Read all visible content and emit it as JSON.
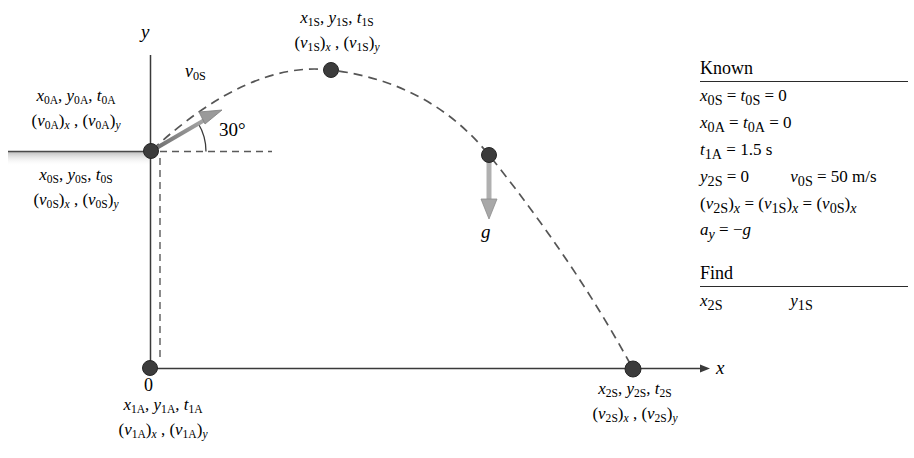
{
  "figure": {
    "type": "projectile-motion-free-body-diagram",
    "axes": {
      "x_label": "x",
      "y_label": "y",
      "origin_label": "0"
    },
    "angle": {
      "value": "30°"
    },
    "gravity": {
      "label": "g"
    },
    "velocity_vector": {
      "label_base": "v",
      "label_sub": "0S"
    }
  },
  "labels": {
    "launch_above": {
      "line1": [
        {
          "base": "x",
          "sub": "0A"
        },
        {
          "base": "y",
          "sub": "0A"
        },
        {
          "base": "t",
          "sub": "0A"
        }
      ],
      "line2": [
        {
          "paren": "v",
          "sub": "0A",
          "comp": "x"
        },
        {
          "paren": "v",
          "sub": "0A",
          "comp": "y"
        }
      ]
    },
    "launch_below": {
      "line1": [
        {
          "base": "x",
          "sub": "0S"
        },
        {
          "base": "y",
          "sub": "0S"
        },
        {
          "base": "t",
          "sub": "0S"
        }
      ],
      "line2": [
        {
          "paren": "v",
          "sub": "0S",
          "comp": "x"
        },
        {
          "paren": "v",
          "sub": "0S",
          "comp": "y"
        }
      ]
    },
    "apex": {
      "line1": [
        {
          "base": "x",
          "sub": "1S"
        },
        {
          "base": "y",
          "sub": "1S"
        },
        {
          "base": "t",
          "sub": "1S"
        }
      ],
      "line2": [
        {
          "paren": "v",
          "sub": "1S",
          "comp": "x"
        },
        {
          "paren": "v",
          "sub": "1S",
          "comp": "y"
        }
      ]
    },
    "origin_below": {
      "line1": [
        {
          "base": "x",
          "sub": "1A"
        },
        {
          "base": "y",
          "sub": "1A"
        },
        {
          "base": "t",
          "sub": "1A"
        }
      ],
      "line2": [
        {
          "paren": "v",
          "sub": "1A",
          "comp": "x"
        },
        {
          "paren": "v",
          "sub": "1A",
          "comp": "y"
        }
      ]
    },
    "landing": {
      "line1": [
        {
          "base": "x",
          "sub": "2S"
        },
        {
          "base": "y",
          "sub": "2S"
        },
        {
          "base": "t",
          "sub": "2S"
        }
      ],
      "line2": [
        {
          "paren": "v",
          "sub": "2S",
          "comp": "x"
        },
        {
          "paren": "v",
          "sub": "2S",
          "comp": "y"
        }
      ]
    }
  },
  "known_panel": {
    "heading": "Known",
    "lines": [
      "x<sub>0S</sub> = t<sub>0S</sub> = 0",
      "x<sub>0A</sub> = t<sub>0A</sub> = 0",
      "t<sub>1A</sub> = 1.5 s",
      "y<sub>2S</sub> = 0",
      "v<sub>0S</sub> = 50 m/s",
      "(v<sub>2S</sub>)<sub>x</sub> = (v<sub>1S</sub>)<sub>x</sub> = (v<sub>0S</sub>)<sub>x</sub>",
      "a<sub>y</sub> = −g"
    ],
    "plain": {
      "l1": "x0S = t0S = 0",
      "l2": "x0A = t0A = 0",
      "l3": "t1A = 1.5 s",
      "l4a": "y2S = 0",
      "l4b": "v0S = 50 m/s",
      "l5": "(v2S)x = (v1S)x = (v0S)x",
      "l6": "ay = −g"
    },
    "values": {
      "t1A": "1.5 s",
      "v0S": "50 m/s",
      "y2S": "0",
      "angle": "30°"
    }
  },
  "find_panel": {
    "heading": "Find",
    "items": [
      {
        "base": "x",
        "sub": "2S"
      },
      {
        "base": "y",
        "sub": "1S"
      }
    ]
  },
  "colors": {
    "ink": "#1a1a1a",
    "axis": "#3a3a3a",
    "dot": "#404040",
    "arrow": "#8a8a8a",
    "ground": "#c8c8c8",
    "trajectory": "#555555"
  },
  "geometry": {
    "launch_point": {
      "x": 151,
      "y": 151
    },
    "origin": {
      "x": 150,
      "y": 368
    },
    "apex_point": {
      "x": 331,
      "y": 70
    },
    "gravity_point": {
      "x": 489,
      "y": 155
    },
    "landing_point": {
      "x": 633,
      "y": 370
    }
  }
}
